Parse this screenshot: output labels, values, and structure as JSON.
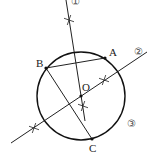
{
  "diagram": {
    "circle": {
      "cx": 81,
      "cy": 96,
      "r": 44
    },
    "points": {
      "A": {
        "label": "A",
        "x": 105,
        "y": 58,
        "label_x": 109,
        "label_y": 56
      },
      "B": {
        "label": "B",
        "x": 46,
        "y": 68,
        "label_x": 36,
        "label_y": 67
      },
      "C": {
        "label": "C",
        "x": 92,
        "y": 139,
        "label_x": 89,
        "label_y": 152
      },
      "O": {
        "label": "O",
        "x": 81,
        "y": 96,
        "label_x": 82,
        "label_y": 91
      }
    },
    "segments": [
      {
        "name": "segment-AB",
        "from": "A",
        "to": "B"
      },
      {
        "name": "segment-BC",
        "from": "B",
        "to": "C"
      }
    ],
    "lines": {
      "line1": {
        "label": "①",
        "x1": 66,
        "y1": 0,
        "x2": 85,
        "y2": 121,
        "label_x": 71,
        "label_y": 5
      },
      "line2": {
        "label": "②",
        "x1": 11,
        "y1": 143,
        "x2": 147,
        "y2": 52,
        "label_x": 134,
        "label_y": 55
      },
      "circle_label": {
        "label": "③",
        "x": 127,
        "y": 127
      }
    },
    "arc_marks": [
      {
        "x": 69,
        "y": 20
      },
      {
        "x": 104,
        "y": 80
      },
      {
        "x": 83,
        "y": 106
      },
      {
        "x": 34,
        "y": 128
      }
    ]
  }
}
